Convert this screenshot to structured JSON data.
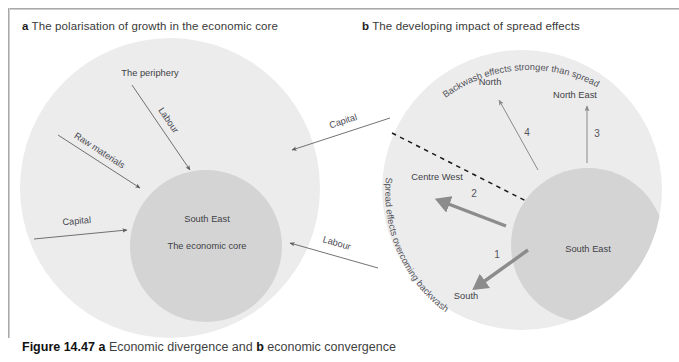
{
  "figure": {
    "caption_prefix": "Figure 14.47",
    "caption_a_marker": "a",
    "caption_a_text": "Economic divergence and",
    "caption_b_marker": "b",
    "caption_b_text": "economic convergence"
  },
  "colors": {
    "periphery_fill": "#ececec",
    "core_fill": "#d4d4d4",
    "thin_arrow": "#5a5a5a",
    "thick_arrow": "#8c8c8c",
    "dashed_line": "#1a1a1a",
    "text": "#3f3f46",
    "frame": "#9a9a9a",
    "page_background": "#ffffff"
  },
  "panel_a": {
    "marker": "a",
    "heading": "The polarisation of growth in the economic core",
    "outer_region_label": "The periphery",
    "inner_region_labels": [
      "South East",
      "The economic core"
    ],
    "internal_flows": [
      {
        "label": "Labour",
        "direction": "inward-down-right"
      },
      {
        "label": "Raw materials",
        "direction": "inward-down-right"
      },
      {
        "label": "Capital",
        "direction": "inward-right"
      }
    ],
    "external_flows": [
      {
        "label": "Capital",
        "direction": "inward-left"
      },
      {
        "label": "Labour",
        "direction": "inward-left"
      }
    ]
  },
  "panel_b": {
    "marker": "b",
    "heading": "The developing impact of spread effects",
    "curved_labels": [
      {
        "text": "Backwash effects stronger than spread",
        "position": "top-arc"
      },
      {
        "text": "Spread effects overcoming backwash",
        "position": "left-arc"
      }
    ],
    "region_labels": [
      "North",
      "North East",
      "Centre West",
      "South",
      "South East"
    ],
    "spread_arrows": [
      {
        "number": "1",
        "target": "South",
        "style": "thick",
        "direction": "down-left"
      },
      {
        "number": "2",
        "target": "Centre West",
        "style": "thick",
        "direction": "up-left"
      },
      {
        "number": "3",
        "target": "North East",
        "style": "thin",
        "direction": "up"
      },
      {
        "number": "4",
        "target": "North",
        "style": "thin",
        "direction": "up-left"
      }
    ],
    "divider": {
      "type": "dashed-line",
      "orientation": "diagonal"
    }
  }
}
